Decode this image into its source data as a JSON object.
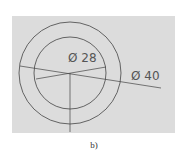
{
  "figure": {
    "caption": "b)",
    "dimensions": [
      {
        "label": "Ø 28",
        "value": 28,
        "type": "diameter",
        "circle": "inner"
      },
      {
        "label": "Ø 40",
        "value": 40,
        "type": "diameter",
        "circle": "outer"
      }
    ],
    "colors": {
      "background": "#dcdcdc",
      "line": "#444444"
    }
  }
}
